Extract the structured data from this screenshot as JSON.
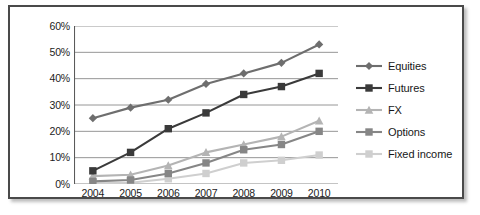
{
  "chart_data": {
    "type": "line",
    "title": "",
    "xlabel": "",
    "ylabel": "",
    "categories": [
      "2004",
      "2005",
      "2006",
      "2007",
      "2008",
      "2009",
      "2010"
    ],
    "ylim": [
      0,
      60
    ],
    "ytick_labels": [
      "60%",
      "50%",
      "40%",
      "30%",
      "20%",
      "10%",
      "0%"
    ],
    "ytick_values": [
      60,
      50,
      40,
      30,
      20,
      10,
      0
    ],
    "grid": true,
    "legend_position": "right",
    "value_suffix": "%",
    "series": [
      {
        "name": "Equities",
        "marker": "diamond",
        "color": "#6e6e6e",
        "values": [
          25,
          29,
          32,
          38,
          42,
          46,
          53
        ]
      },
      {
        "name": "Futures",
        "marker": "square",
        "color": "#3a3a3a",
        "values": [
          5,
          12,
          21,
          27,
          34,
          37,
          42
        ]
      },
      {
        "name": "FX",
        "marker": "triangle",
        "color": "#b4b4b4",
        "values": [
          3,
          3.5,
          7,
          12,
          15,
          18,
          24
        ]
      },
      {
        "name": "Options",
        "marker": "square",
        "color": "#868686",
        "values": [
          1,
          1.5,
          4,
          8,
          13,
          15,
          20
        ]
      },
      {
        "name": "Fixed income",
        "marker": "square",
        "color": "#cfcfcf",
        "values": [
          0.3,
          0.5,
          2,
          4,
          8,
          9,
          11
        ]
      }
    ]
  },
  "frame": {
    "border_color": "#4a4a4a",
    "background": "#ffffff",
    "axis_color": "#5a5a5a",
    "grid_color": "#8a8a8a"
  }
}
